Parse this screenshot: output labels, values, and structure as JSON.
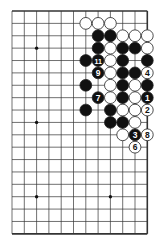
{
  "diagram": {
    "type": "go-board-fragment",
    "columns": 12,
    "rows": 19,
    "origin_x": 12,
    "origin_y": 11,
    "spacing_x": 12.3,
    "spacing_y": 12.38,
    "edges": {
      "top": true,
      "right": true,
      "bottom": true,
      "left": false
    },
    "colors": {
      "line": "#333333",
      "black": "#111111",
      "white": "#ffffff",
      "stroke": "#222222"
    },
    "star_points": [
      {
        "c": 2,
        "r": 3
      },
      {
        "c": 2,
        "r": 9
      },
      {
        "c": 2,
        "r": 15
      },
      {
        "c": 8,
        "r": 15
      }
    ],
    "stones": [
      {
        "c": 6,
        "r": 1,
        "color": "white"
      },
      {
        "c": 7,
        "r": 1,
        "color": "white"
      },
      {
        "c": 8,
        "r": 1,
        "color": "white"
      },
      {
        "c": 7,
        "r": 2,
        "color": "black"
      },
      {
        "c": 8,
        "r": 2,
        "color": "black"
      },
      {
        "c": 9,
        "r": 2,
        "color": "white"
      },
      {
        "c": 10,
        "r": 2,
        "color": "white"
      },
      {
        "c": 11,
        "r": 2,
        "color": "white"
      },
      {
        "c": 7,
        "r": 3,
        "color": "black"
      },
      {
        "c": 8,
        "r": 3,
        "color": "white"
      },
      {
        "c": 9,
        "r": 3,
        "color": "black"
      },
      {
        "c": 10,
        "r": 3,
        "color": "black"
      },
      {
        "c": 11,
        "r": 3,
        "color": "white"
      },
      {
        "c": 6,
        "r": 4,
        "color": "black"
      },
      {
        "c": 7,
        "r": 4,
        "color": "black",
        "label": "11"
      },
      {
        "c": 8,
        "r": 4,
        "color": "white"
      },
      {
        "c": 9,
        "r": 4,
        "color": "black"
      },
      {
        "c": 11,
        "r": 4,
        "color": "black"
      },
      {
        "c": 7,
        "r": 5,
        "color": "black",
        "label": "9"
      },
      {
        "c": 8,
        "r": 5,
        "color": "white"
      },
      {
        "c": 9,
        "r": 5,
        "color": "black"
      },
      {
        "c": 10,
        "r": 5,
        "color": "black"
      },
      {
        "c": 11,
        "r": 5,
        "color": "white",
        "label": "4"
      },
      {
        "c": 6,
        "r": 6,
        "color": "black"
      },
      {
        "c": 8,
        "r": 6,
        "color": "white"
      },
      {
        "c": 9,
        "r": 6,
        "color": "black"
      },
      {
        "c": 10,
        "r": 6,
        "color": "white"
      },
      {
        "c": 11,
        "r": 6,
        "color": "black"
      },
      {
        "c": 7,
        "r": 7,
        "color": "black",
        "label": "7"
      },
      {
        "c": 8,
        "r": 7,
        "color": "white"
      },
      {
        "c": 9,
        "r": 7,
        "color": "black"
      },
      {
        "c": 10,
        "r": 7,
        "color": "white"
      },
      {
        "c": 11,
        "r": 7,
        "color": "black",
        "label": "1"
      },
      {
        "c": 6,
        "r": 8,
        "color": "black"
      },
      {
        "c": 8,
        "r": 8,
        "color": "black"
      },
      {
        "c": 9,
        "r": 8,
        "color": "white"
      },
      {
        "c": 10,
        "r": 8,
        "color": "white"
      },
      {
        "c": 11,
        "r": 8,
        "color": "white",
        "label": "2"
      },
      {
        "c": 8,
        "r": 9,
        "color": "black"
      },
      {
        "c": 9,
        "r": 9,
        "color": "black"
      },
      {
        "c": 10,
        "r": 9,
        "color": "white"
      },
      {
        "c": 9,
        "r": 10,
        "color": "white"
      },
      {
        "c": 10,
        "r": 10,
        "color": "black",
        "label": "3"
      },
      {
        "c": 11,
        "r": 10,
        "color": "white",
        "label": "8"
      },
      {
        "c": 10,
        "r": 11,
        "color": "white",
        "label": "6"
      }
    ]
  }
}
